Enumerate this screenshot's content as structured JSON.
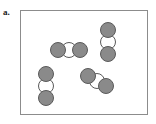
{
  "figure": {
    "panel_label": "a.",
    "width": 156,
    "height": 124,
    "background_color": "#ffffff"
  },
  "container": {
    "name": "reaction-vessel-box",
    "x": 20,
    "y": 10,
    "width": 128,
    "height": 105,
    "border_color": "#8c8c8c",
    "fill_color": "#ffffff"
  },
  "legend": {
    "shaded_atom_color": "#8a8a8a",
    "open_atom_color": "#ffffff",
    "outline_color": "#5a5a5a"
  },
  "chart_data": {
    "type": "scatter",
    "title": "a.",
    "xlabel": "",
    "ylabel": "",
    "xlim": [
      20,
      148
    ],
    "ylim": [
      10,
      115
    ],
    "grid": false,
    "legend_position": "none",
    "molecule_count": 4,
    "atoms_per_molecule": 3,
    "atom_radius": 8,
    "series": [
      {
        "name": "shaded-atoms",
        "color": "#8a8a8a",
        "x": [
          58,
          80,
          108,
          108,
          46,
          46,
          88,
          106
        ],
        "y": [
          50,
          50,
          30,
          54,
          74,
          98,
          76,
          86
        ]
      },
      {
        "name": "open-atoms",
        "color": "#ffffff",
        "x": [
          69,
          108,
          46,
          97
        ],
        "y": [
          50,
          42,
          86,
          81
        ]
      }
    ],
    "molecules": [
      {
        "id": "molecule-horizontal-center",
        "orientation": "horizontal",
        "atoms": [
          {
            "type": "shaded",
            "cx": 58,
            "cy": 50
          },
          {
            "type": "open",
            "cx": 69,
            "cy": 50
          },
          {
            "type": "shaded",
            "cx": 80,
            "cy": 50
          }
        ]
      },
      {
        "id": "molecule-vertical-right",
        "orientation": "vertical",
        "atoms": [
          {
            "type": "shaded",
            "cx": 108,
            "cy": 30
          },
          {
            "type": "open",
            "cx": 108,
            "cy": 42
          },
          {
            "type": "shaded",
            "cx": 108,
            "cy": 54
          }
        ]
      },
      {
        "id": "molecule-vertical-lower-left",
        "orientation": "vertical",
        "atoms": [
          {
            "type": "shaded",
            "cx": 46,
            "cy": 74
          },
          {
            "type": "open",
            "cx": 46,
            "cy": 86
          },
          {
            "type": "shaded",
            "cx": 46,
            "cy": 98
          }
        ]
      },
      {
        "id": "molecule-diagonal-lower-right",
        "orientation": "diagonal",
        "atoms": [
          {
            "type": "shaded",
            "cx": 88,
            "cy": 76
          },
          {
            "type": "open",
            "cx": 97,
            "cy": 81
          },
          {
            "type": "shaded",
            "cx": 106,
            "cy": 86
          }
        ]
      }
    ]
  }
}
